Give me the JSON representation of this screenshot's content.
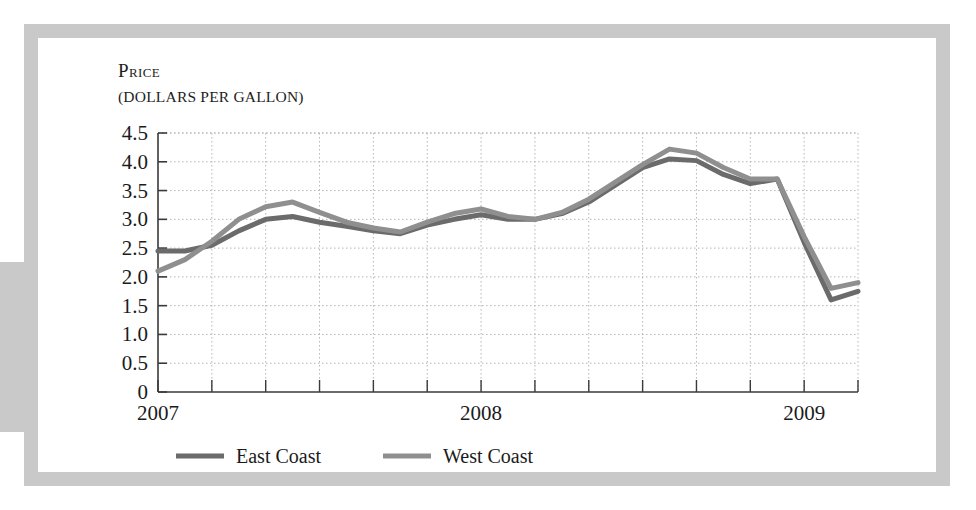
{
  "figure": {
    "title_main": "Price",
    "title_sub": "(DOLLARS PER GALLON)"
  },
  "chart_data": {
    "type": "line",
    "title": "Price",
    "subtitle": "(DOLLARS PER GALLON)",
    "xlabel": "",
    "ylabel": "Price (dollars per gallon)",
    "ylim": [
      0,
      4.5
    ],
    "ytick_labels": [
      "0",
      "0.5",
      "1.0",
      "1.5",
      "2.0",
      "2.5",
      "3.0",
      "3.5",
      "4.0",
      "4.5"
    ],
    "ytick_values": [
      0,
      0.5,
      1.0,
      1.5,
      2.0,
      2.5,
      3.0,
      3.5,
      4.0,
      4.5
    ],
    "xtick_labels": [
      "2007",
      "2008",
      "2009"
    ],
    "xtick_values": [
      0,
      12,
      24
    ],
    "xlim": [
      0,
      26
    ],
    "x_minor_interval": 2,
    "grid": true,
    "grid_style": "dotted",
    "legend_position": "below-left",
    "series": [
      {
        "name": "East Coast",
        "color": "#6b6b6b",
        "x": [
          0,
          1,
          2,
          3,
          4,
          5,
          6,
          7,
          8,
          9,
          10,
          11,
          12,
          13,
          14,
          15,
          16,
          17,
          18,
          19,
          20,
          21,
          22,
          23,
          24,
          25,
          26
        ],
        "values": [
          2.45,
          2.45,
          2.55,
          2.8,
          3.0,
          3.05,
          2.95,
          2.88,
          2.8,
          2.75,
          2.9,
          3.0,
          3.08,
          3.0,
          3.0,
          3.1,
          3.3,
          3.6,
          3.9,
          4.05,
          4.02,
          3.78,
          3.62,
          3.7,
          2.6,
          1.6,
          1.75
        ]
      },
      {
        "name": "West Coast",
        "color": "#8f8f8f",
        "x": [
          0,
          1,
          2,
          3,
          4,
          5,
          6,
          7,
          8,
          9,
          10,
          11,
          12,
          13,
          14,
          15,
          16,
          17,
          18,
          19,
          20,
          21,
          22,
          23,
          24,
          25,
          26
        ],
        "values": [
          2.1,
          2.3,
          2.62,
          3.0,
          3.22,
          3.3,
          3.12,
          2.95,
          2.85,
          2.78,
          2.95,
          3.1,
          3.18,
          3.05,
          3.0,
          3.12,
          3.35,
          3.65,
          3.95,
          4.22,
          4.15,
          3.9,
          3.7,
          3.7,
          2.7,
          1.8,
          1.9
        ]
      }
    ],
    "annotations": []
  },
  "legend": {
    "items": [
      {
        "label": "East Coast",
        "color": "#6b6b6b"
      },
      {
        "label": "West Coast",
        "color": "#8f8f8f"
      }
    ]
  },
  "colors": {
    "frame": "#c9c9c9",
    "axis": "#3a3a3a",
    "grid": "#b4b4b4",
    "text": "#1b1b1b",
    "east_coast": "#6b6b6b",
    "west_coast": "#8f8f8f"
  }
}
